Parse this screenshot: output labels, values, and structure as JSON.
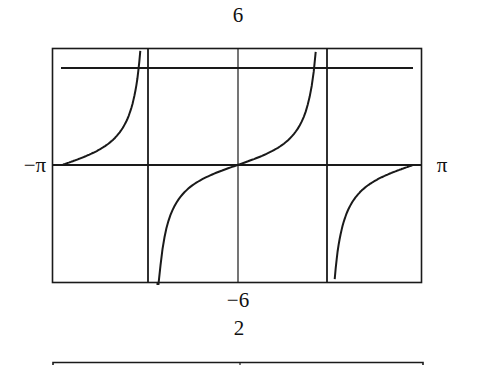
{
  "chart_data": [
    {
      "type": "line",
      "title": "",
      "function": "y = tan(x)",
      "xlabel": "",
      "ylabel": "",
      "xlim": [
        -3.14159,
        3.14159
      ],
      "ylim": [
        -6,
        6
      ],
      "x_tick_labels": {
        "left": "−π",
        "right": "π"
      },
      "y_tick_labels": {
        "top": "6",
        "bottom": "−6"
      },
      "vertical_lines_x": [
        -1.5708,
        0,
        1.5708
      ],
      "horizontal_lines_y": [
        0,
        5
      ],
      "grid": false,
      "series": [
        {
          "name": "tan(x)",
          "branches": [
            {
              "x_start": -3.14159,
              "x_end": -1.74
            },
            {
              "x_start": -1.45,
              "x_end": 1.4
            },
            {
              "x_start": 1.74,
              "x_end": 3.14159
            }
          ]
        }
      ]
    },
    {
      "type": "line",
      "title": "",
      "y_tick_labels": {
        "top": "2"
      },
      "note": "second plot cut off at bottom edge"
    }
  ],
  "labels": {
    "top_y": "6",
    "bottom_y": "−6",
    "left_x": "−π",
    "right_x": "π",
    "second_top_y": "2"
  }
}
